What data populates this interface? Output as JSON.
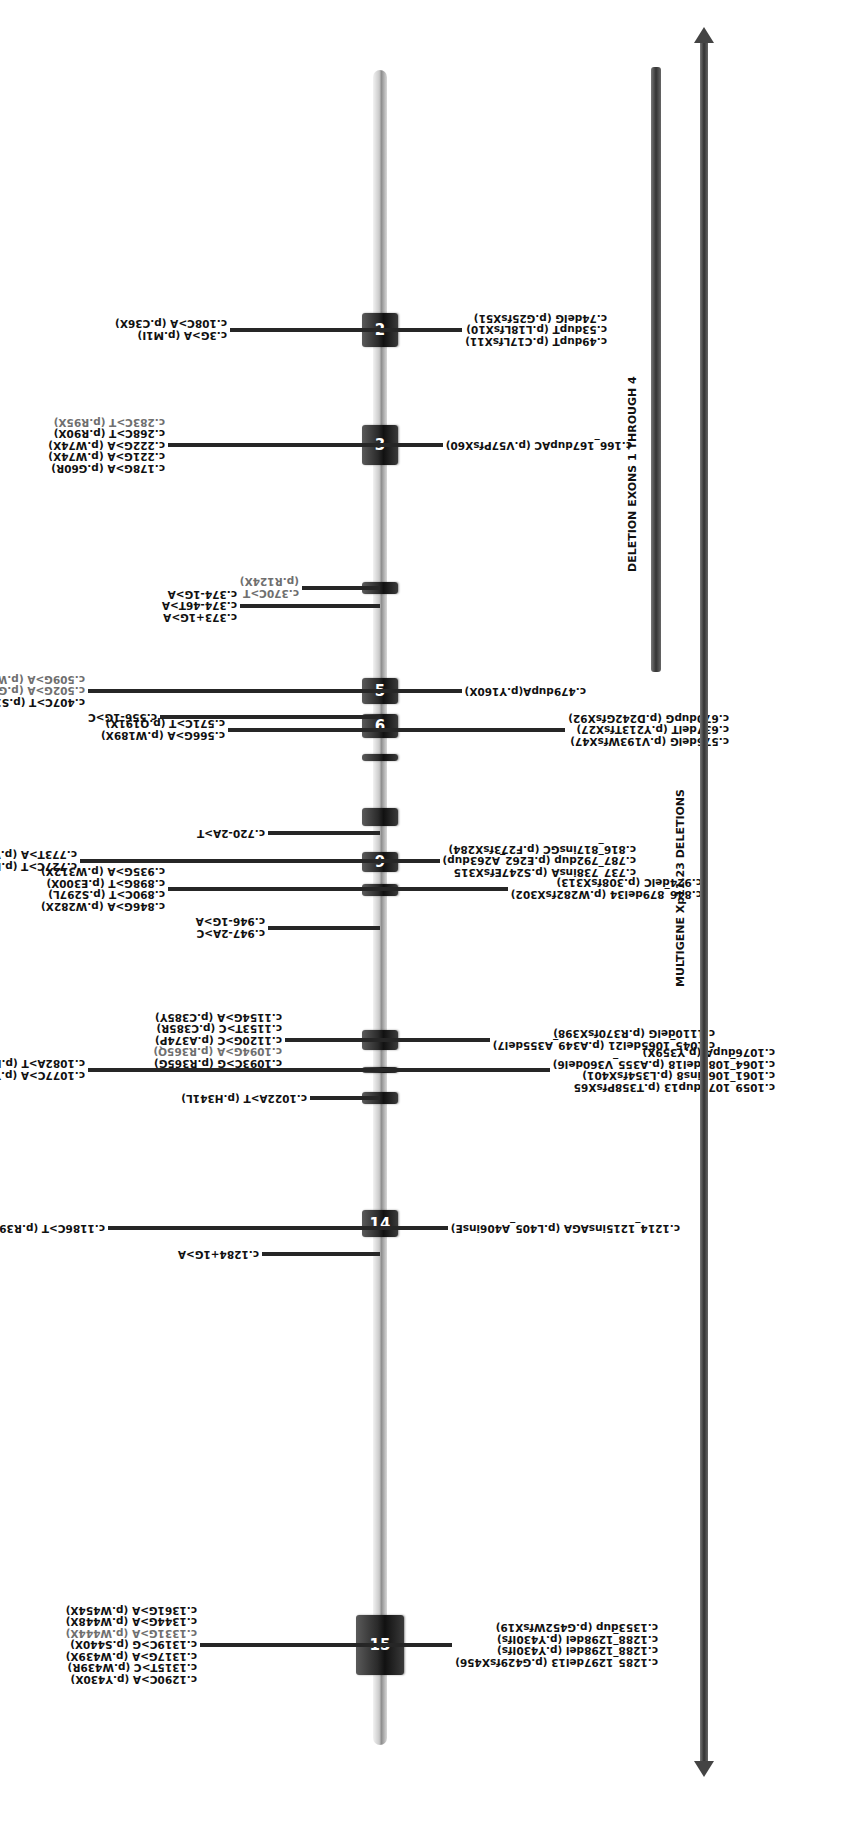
{
  "orientation": "rotated -90deg (figure drawn horizontally, displayed vertically)",
  "gene_axis": {
    "x_start": 92,
    "x_end": 1767,
    "y": 380
  },
  "exons": [
    {
      "label": "2",
      "x": 1490,
      "w": 34,
      "numbered": true
    },
    {
      "label": "3",
      "x": 1372,
      "w": 40,
      "numbered": true
    },
    {
      "label": "",
      "x": 1243,
      "w": 12,
      "numbered": false
    },
    {
      "label": "5",
      "x": 1133,
      "w": 26,
      "numbered": true
    },
    {
      "label": "6",
      "x": 1099,
      "w": 24,
      "numbered": true
    },
    {
      "label": "",
      "x": 1076,
      "w": 7,
      "numbered": false
    },
    {
      "label": "",
      "x": 941,
      "w": 12,
      "numbered": false
    },
    {
      "label": "9",
      "x": 965,
      "w": 20,
      "numbered": true
    },
    {
      "label": "",
      "x": 1011,
      "w": 18,
      "numbered": false
    },
    {
      "label": "",
      "x": 733,
      "w": 12,
      "numbered": false
    },
    {
      "label": "",
      "x": 764,
      "w": 6,
      "numbered": false
    },
    {
      "label": "",
      "x": 787,
      "w": 20,
      "numbered": false
    },
    {
      "label": "14",
      "x": 600,
      "w": 27,
      "numbered": true
    },
    {
      "label": "15",
      "x": 162,
      "w": 60,
      "numbered": true
    }
  ],
  "mutations_top": [
    {
      "id": "exon2-top",
      "x": 1507,
      "stem_from": 230,
      "lines": [
        {
          "text": "c.3G>A (p.M1I)",
          "gray": false
        },
        {
          "text": "c.108C>A (p.C36X)",
          "gray": false
        }
      ]
    },
    {
      "id": "exon3-top",
      "x": 1392,
      "stem_from": 168,
      "lines": [
        {
          "text": "c.178G>A (p.G60R)",
          "gray": false
        },
        {
          "text": "c.221G>A (p.W74X)",
          "gray": false
        },
        {
          "text": "c.222G>A (p.W74X)",
          "gray": false
        },
        {
          "text": "c.268C>T (p.R90X)",
          "gray": false
        },
        {
          "text": "c.283C>T (p.R95X)",
          "gray": true
        }
      ]
    },
    {
      "id": "c370",
      "x": 1249,
      "stem_from": 302,
      "lines": [
        {
          "text": "c.370C>T",
          "gray": true
        },
        {
          "text": "(p.R124X)",
          "gray": true
        }
      ]
    },
    {
      "id": "intron4-top",
      "x": 1231,
      "stem_from": 240,
      "lines": [
        {
          "text": "c.373+1G>A",
          "gray": false
        },
        {
          "text": "c.374-46T>A",
          "gray": false
        },
        {
          "text": "c.374-1G>A",
          "gray": false
        }
      ]
    },
    {
      "id": "exon5-top",
      "x": 1146,
      "stem_from": 88,
      "lines": [
        {
          "text": "c.407C>T (p.S136F)",
          "gray": false
        },
        {
          "text": "c.502G>A (p.G168R)",
          "gray": true
        },
        {
          "text": "c.509G>A (p.W170X)",
          "gray": true
        }
      ]
    },
    {
      "id": "c556",
      "x": 1120,
      "stem_from": 160,
      "lines": [
        {
          "text": "c.556-1G>C",
          "gray": false
        }
      ]
    },
    {
      "id": "exon6-top",
      "x": 1107,
      "stem_from": 228,
      "lines": [
        {
          "text": "c.566G>A (p.W189X)",
          "gray": false
        },
        {
          "text": "c.571C>T (p.Q191X)",
          "gray": false
        }
      ]
    },
    {
      "id": "c720",
      "x": 1004,
      "stem_from": 268,
      "lines": [
        {
          "text": "c.720-2A>T",
          "gray": false
        }
      ]
    },
    {
      "id": "exon9-top",
      "x": 976,
      "stem_from": 80,
      "lines": [
        {
          "text": "c.727C>T (p.R234X)",
          "gray": false
        },
        {
          "text": "c.773T>A (p.V258E)",
          "gray": false
        }
      ]
    },
    {
      "id": "exon10-top",
      "x": 948,
      "stem_from": 168,
      "lines": [
        {
          "text": "c.846G>A (p.W282X)",
          "gray": false
        },
        {
          "text": "c.890C>T (p.S297L)",
          "gray": false
        },
        {
          "text": "c.898G>T (p.E300X)",
          "gray": false
        },
        {
          "text": "c.935G>A (p.W312X)",
          "gray": false
        }
      ]
    },
    {
      "id": "intron10-top",
      "x": 909,
      "stem_from": 268,
      "lines": [
        {
          "text": "c.947-2A>C",
          "gray": false
        },
        {
          "text": "c.946-1G>A",
          "gray": false
        }
      ]
    },
    {
      "id": "c1022",
      "x": 739,
      "stem_from": 310,
      "lines": [
        {
          "text": "c.1022A>T (p.H341L)",
          "gray": false
        }
      ]
    },
    {
      "id": "exon12-top",
      "x": 767,
      "stem_from": 88,
      "lines": [
        {
          "text": "c.1077C>A (p.Y359X)",
          "gray": false
        },
        {
          "text": "c.1082A>T (p.E361V)",
          "gray": false
        }
      ]
    },
    {
      "id": "exon13-top",
      "x": 797,
      "stem_from": 285,
      "lines": [
        {
          "text": "c.1093C>G (p.R365G)",
          "gray": false
        },
        {
          "text": "c.1094G>A (p.R365Q)",
          "gray": true
        },
        {
          "text": "c.1120G>C (p.A374P)",
          "gray": false
        },
        {
          "text": "c.1153T>C (p.C385R)",
          "gray": false
        },
        {
          "text": "c.1154G>A (p.C385Y)",
          "gray": false
        }
      ]
    },
    {
      "id": "exon14-top",
      "x": 609,
      "stem_from": 108,
      "lines": [
        {
          "text": "c.1186C>T (p.R396X)",
          "gray": false
        }
      ]
    },
    {
      "id": "c1284",
      "x": 583,
      "stem_from": 262,
      "lines": [
        {
          "text": "c.1284+1G>A",
          "gray": false
        }
      ]
    },
    {
      "id": "exon15-top",
      "x": 192,
      "stem_from": 200,
      "lines": [
        {
          "text": "c.1290C>A (p.Y430X)",
          "gray": false
        },
        {
          "text": "c.1315T>C (p.W439R)",
          "gray": false
        },
        {
          "text": "c.1317G>A (p.W439X)",
          "gray": false
        },
        {
          "text": "c.1319C>G (p.S440X)",
          "gray": false
        },
        {
          "text": "c.1331G>A (p.W444X)",
          "gray": true
        },
        {
          "text": "c.1344G>A (p.W448X)",
          "gray": false
        },
        {
          "text": "c.1361G>A (p.W454X)",
          "gray": false
        }
      ]
    }
  ],
  "mutations_bottom": [
    {
      "id": "exon2-bottom",
      "x": 1507,
      "stem_to": 462,
      "lines": [
        {
          "text": "c.49dupT (p.C17LfsX11)",
          "gray": false
        },
        {
          "text": "c.53dupT (p.L18LfsX10)",
          "gray": false
        },
        {
          "text": "c.74delG (p.G25fsX51)",
          "gray": false
        }
      ]
    },
    {
      "id": "exon3-bottom",
      "x": 1392,
      "stem_to": 443,
      "lines": [
        {
          "text": "c.166_167dupAC (p.V57PfsX60)",
          "gray": false
        }
      ]
    },
    {
      "id": "exon5-bottom",
      "x": 1146,
      "stem_to": 462,
      "lines": [
        {
          "text": "c.479dupA(p.Y160X)",
          "gray": false
        }
      ]
    },
    {
      "id": "exon6-bottom",
      "x": 1107,
      "stem_to": 565,
      "lines": [
        {
          "text": "c.576delG (p.V193WfsX47)",
          "gray": false
        },
        {
          "text": "c.637delT (p.Y213TfsX27)",
          "gray": false
        },
        {
          "text": "c.670dupG (p.D242GfsX92)",
          "gray": false
        }
      ]
    },
    {
      "id": "exon9-bottom",
      "x": 976,
      "stem_to": 440,
      "lines": [
        {
          "text": "c.737_738insA (p.S247EfsX315",
          "gray": false
        },
        {
          "text": "c.787_792dup (p.E262_A263dup)",
          "gray": false
        },
        {
          "text": "c.816_817insGC (p.F273fsX284)",
          "gray": false
        }
      ]
    },
    {
      "id": "exon10-bottom",
      "x": 948,
      "stem_to": 508,
      "lines": [
        {
          "text": "c.846_879del34 (p.W282fsX302)",
          "gray": false
        },
        {
          "text": "c.924delC (p.308fsX313)",
          "gray": false
        }
      ]
    },
    {
      "id": "exon12-bottom",
      "x": 767,
      "stem_to": 550,
      "lines": [
        {
          "text": "c.1059_1071dup13 (p.T358PfsX65",
          "gray": false
        },
        {
          "text": "c.1061_1062ins8 (p.L354fsX401)",
          "gray": false
        },
        {
          "text": "c.1064_1081del18 (p.A355_V360del6)",
          "gray": false
        },
        {
          "text": "c.1076dupA (p.Y359X)",
          "gray": false
        }
      ]
    },
    {
      "id": "exon13-bottom",
      "x": 797,
      "stem_to": 490,
      "lines": [
        {
          "text": "c.1045_1065del21 (p.A349_A355del7)",
          "gray": false
        },
        {
          "text": "c.1110delG (p.R370fsX398)",
          "gray": false
        }
      ]
    },
    {
      "id": "exon14-bottom",
      "x": 609,
      "stem_to": 448,
      "lines": [
        {
          "text": "c.1214_1215insAGA (p.L405_A406insE)",
          "gray": false
        }
      ]
    },
    {
      "id": "exon15-bottom",
      "x": 192,
      "stem_to": 452,
      "lines": [
        {
          "text": "c.1285_1297del13 (p.G429fsX456)",
          "gray": false
        },
        {
          "text": "c.1288_1298del (p.Y430Ifs)",
          "gray": false
        },
        {
          "text": "c.1288_1298del (p.Y430Ifs)",
          "gray": false
        },
        {
          "text": "c.1353dup (p.G452WfsX19)",
          "gray": false
        }
      ]
    }
  ],
  "deletions": {
    "exons_1_4": {
      "label": "DELETION EXONS 1 THROUGH 4",
      "x_start": 1165,
      "x_end": 1770,
      "y": 656
    },
    "multigene": {
      "label": "MULTIGENE Xp11.23 DELETIONS",
      "x_start": 60,
      "x_end": 1810,
      "y": 704
    }
  },
  "colors": {
    "label_black": "#111111",
    "label_gray": "#6f6f6f",
    "exon": "#2a2a2a",
    "axis": "#c9c9c9",
    "bar": "#444444"
  }
}
